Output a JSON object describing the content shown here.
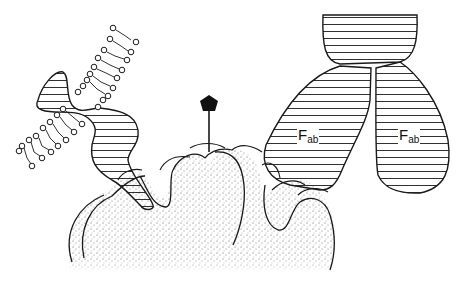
{
  "diagram": {
    "type": "schematic illustration",
    "elements": [
      {
        "id": "antigen-surface",
        "description": "stippled lobed antigen surface"
      },
      {
        "id": "membrane-receptor",
        "description": "hatched receptor protein embedded in lipid bilayer, upper-left"
      },
      {
        "id": "hapten",
        "description": "black pentagon on a stick rising from the antigen surface"
      },
      {
        "id": "antibody",
        "description": "hatched antibody with Fc stem and two Fab arms, right side"
      }
    ],
    "labels": {
      "fab_left": {
        "main": "F",
        "sub": "ab"
      },
      "fab_right": {
        "main": "F",
        "sub": "ab"
      }
    },
    "colors": {
      "ink": "#1a1a1a",
      "background": "#ffffff",
      "stipple": "#555555"
    }
  }
}
